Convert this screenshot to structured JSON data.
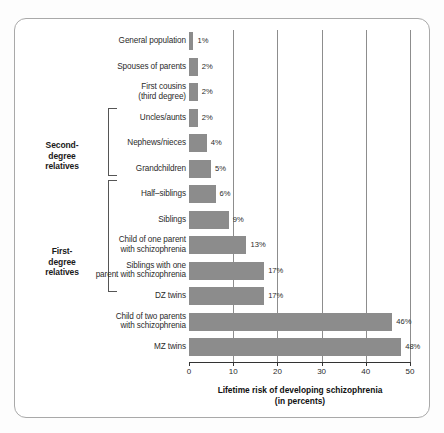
{
  "chart_data": {
    "type": "bar",
    "orientation": "horizontal",
    "title": "",
    "xlabel": "Lifetime risk of developing schizophrenia (in percents)",
    "ylabel": "",
    "xlim": [
      0,
      50
    ],
    "xticks": [
      0,
      10,
      20,
      30,
      40,
      50
    ],
    "grid": true,
    "legend": "none",
    "categories": [
      "General population",
      "Spouses of parents",
      "First cousins (third degree)",
      "Uncles/aunts",
      "Nephews/nieces",
      "Grandchildren",
      "Half-siblings",
      "Siblings",
      "Child of one parent with schizophrenia",
      "Siblings with one parent with schizophrenia",
      "DZ twins",
      "Child of two parents with schizophrenia",
      "MZ twins"
    ],
    "values": [
      1,
      2,
      2,
      2,
      4,
      5,
      6,
      9,
      13,
      17,
      17,
      46,
      48
    ],
    "value_labels": [
      "1%",
      "2%",
      "2%",
      "2%",
      "4%",
      "5%",
      "6%",
      "9%",
      "13%",
      "17%",
      "17%",
      "46%",
      "48%"
    ],
    "bar_color": "#8c8c8c"
  },
  "axis": {
    "title_line1": "Lifetime risk of developing schizophrenia",
    "title_line2": "(in percents)",
    "tick_labels": [
      "0",
      "10",
      "20",
      "30",
      "40",
      "50"
    ]
  },
  "rows": [
    {
      "label_line1": "General population",
      "label_line2": "",
      "value_label": "1%"
    },
    {
      "label_line1": "Spouses of parents",
      "label_line2": "",
      "value_label": "2%"
    },
    {
      "label_line1": "First cousins",
      "label_line2": "(third degree)",
      "value_label": "2%"
    },
    {
      "label_line1": "Uncles/aunts",
      "label_line2": "",
      "value_label": "2%"
    },
    {
      "label_line1": "Nephews/nieces",
      "label_line2": "",
      "value_label": "4%"
    },
    {
      "label_line1": "Grandchildren",
      "label_line2": "",
      "value_label": "5%"
    },
    {
      "label_line1": "Half–siblings",
      "label_line2": "",
      "value_label": "6%"
    },
    {
      "label_line1": "Siblings",
      "label_line2": "",
      "value_label": "9%"
    },
    {
      "label_line1": "Child of one parent",
      "label_line2": "with schizophrenia",
      "value_label": "13%"
    },
    {
      "label_line1": "Siblings with one",
      "label_line2": "parent with schizophrenia",
      "value_label": "17%"
    },
    {
      "label_line1": "DZ twins",
      "label_line2": "",
      "value_label": "17%"
    },
    {
      "label_line1": "Child of two parents",
      "label_line2": "with schizophrenia",
      "value_label": "46%"
    },
    {
      "label_line1": "MZ twins",
      "label_line2": "",
      "value_label": "48%"
    }
  ],
  "groups": {
    "second_degree": {
      "line1": "Second-",
      "line2": "degree",
      "line3": "relatives"
    },
    "first_degree": {
      "line1": "First-",
      "line2": "degree",
      "line3": "relatives"
    }
  }
}
